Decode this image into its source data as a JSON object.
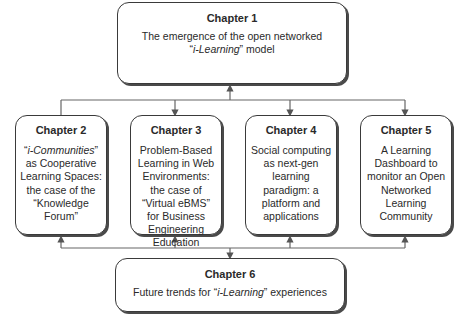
{
  "diagram": {
    "chapters": [
      {
        "title": "Chapter 1",
        "pre": "The emergence of the open networked",
        "quote_open": "“",
        "italic": "i-Learning",
        "quote_close": "”",
        "post": " model"
      },
      {
        "title": "Chapter 2",
        "quote_open": "“",
        "italic": "i-Communities",
        "quote_close": "”",
        "post": " as Cooperative Learning Spaces: the case of the “Knowledge Forum”"
      },
      {
        "title": "Chapter 3",
        "text": "Problem-Based Learning in Web Environments: the case of “Virtual eBMS” for Business Engineering Education"
      },
      {
        "title": "Chapter 4",
        "text": "Social computing as next-gen learning paradigm: a platform and applications"
      },
      {
        "title": "Chapter 5",
        "text": "A Learning Dashboard to monitor an Open Networked Learning Community"
      },
      {
        "title": "Chapter 6",
        "pre": "Future trends for ",
        "quote_open": "“",
        "italic": "i-Learning",
        "quote_close": "”",
        "post": " experiences"
      }
    ],
    "colors": {
      "border": "#3a3a3a",
      "line": "#555555",
      "text": "#2a2a2a"
    }
  }
}
